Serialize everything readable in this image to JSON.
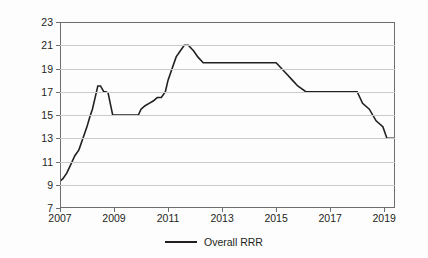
{
  "chart_data": {
    "type": "line",
    "title": "",
    "xlabel": "",
    "ylabel": "Required reserve ratio (%)",
    "xlim": [
      2007.0,
      2019.4
    ],
    "ylim": [
      7,
      23
    ],
    "yticks": [
      7,
      9,
      11,
      13,
      15,
      17,
      19,
      21,
      23
    ],
    "xticks": [
      2007,
      2009,
      2011,
      2013,
      2015,
      2017,
      2019
    ],
    "ytick_labels": [
      "7",
      "9",
      "11",
      "13",
      "15",
      "17",
      "19",
      "21",
      "23"
    ],
    "xtick_labels": [
      "2007",
      "2009",
      "2011",
      "2013",
      "2015",
      "2017",
      "2019"
    ],
    "grid": "horizontal",
    "legend_position": "bottom-center",
    "series": [
      {
        "name": "Overall RRR",
        "color": "#231f20",
        "x": [
          2007.0,
          2007.1,
          2007.25,
          2007.35,
          2007.45,
          2007.55,
          2007.7,
          2007.85,
          2008.0,
          2008.1,
          2008.2,
          2008.3,
          2008.4,
          2008.5,
          2008.62,
          2008.7,
          2008.78,
          2008.86,
          2008.95,
          2009.0,
          2009.9,
          2010.0,
          2010.15,
          2010.3,
          2010.45,
          2010.6,
          2010.75,
          2010.9,
          2011.0,
          2011.15,
          2011.3,
          2011.45,
          2011.6,
          2011.75,
          2011.95,
          2012.1,
          2012.3,
          2012.45,
          2012.6,
          2015.0,
          2015.2,
          2015.4,
          2015.6,
          2015.8,
          2016.1,
          2018.0,
          2018.2,
          2018.45,
          2018.7,
          2018.95,
          2019.1,
          2019.4
        ],
        "y": [
          9.3,
          9.5,
          10.0,
          10.5,
          11.0,
          11.5,
          12.0,
          13.0,
          14.0,
          14.8,
          15.5,
          16.5,
          17.5,
          17.5,
          17.0,
          17.0,
          16.9,
          16.0,
          15.0,
          15.0,
          15.0,
          15.5,
          15.8,
          16.0,
          16.2,
          16.5,
          16.5,
          17.0,
          18.0,
          19.0,
          20.0,
          20.5,
          21.0,
          21.0,
          20.5,
          20.0,
          19.5,
          19.5,
          19.5,
          19.5,
          19.0,
          18.5,
          18.0,
          17.5,
          17.0,
          17.0,
          16.0,
          15.5,
          14.5,
          14.0,
          13.0,
          13.0
        ],
        "notes": "Chinese overall required reserve ratio; rises from ~9.5% in 2007 to peak 21% in 2011-2012, then declines to 13% by 2019"
      }
    ]
  },
  "legend": {
    "entries": [
      {
        "label": "Overall RRR"
      }
    ]
  }
}
